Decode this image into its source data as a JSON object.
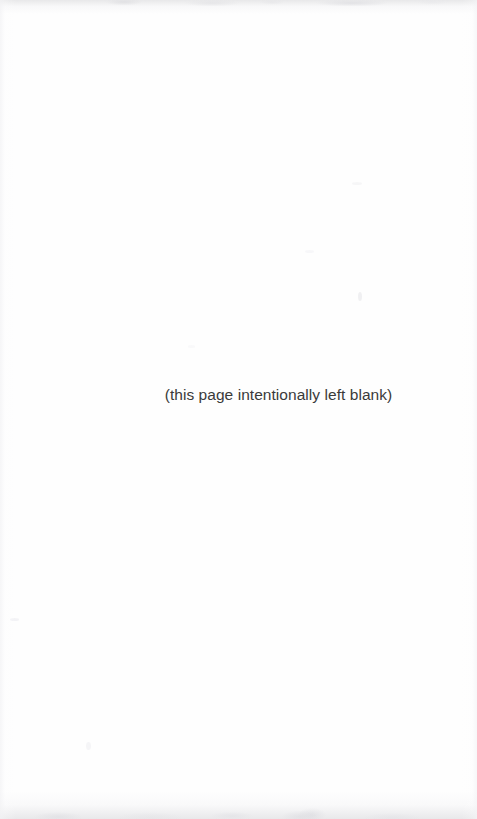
{
  "page": {
    "type": "scanned-document-page",
    "notice_text": "(this page intentionally left blank)",
    "background_color": "#fefefe",
    "text_color": "#3a3a3a",
    "width_px": 477,
    "height_px": 819
  },
  "artifacts": {
    "top_edge_label": "scan-edge-haze-top",
    "bottom_edge_label": "scan-edge-haze-bottom",
    "vignette_label": "scan-vignette",
    "edge_haze_color": "#e6e6e8"
  }
}
